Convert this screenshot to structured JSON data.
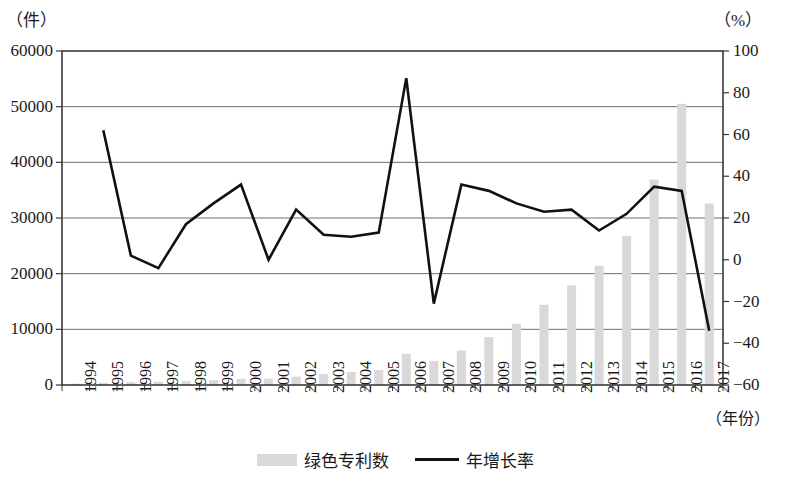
{
  "axes": {
    "left_unit": "（件）",
    "right_unit": "（%）",
    "x_title": "（年份）",
    "left_ticks": [
      "60000",
      "50000",
      "40000",
      "30000",
      "20000",
      "10000",
      "0"
    ],
    "right_ticks": [
      "100",
      "80",
      "60",
      "40",
      "20",
      "0",
      "−20",
      "−40",
      "−60"
    ]
  },
  "legend": {
    "bar_label": "绿色专利数",
    "line_label": "年增长率"
  },
  "colors": {
    "bar": "#d9d9d9",
    "line": "#111111",
    "grid": "#6f6f6f",
    "frame": "#3a3a3a"
  },
  "chart_data": {
    "type": "bar",
    "title": "",
    "subtitle": "",
    "xlabel": "（年份）",
    "ylabel": "（件）",
    "y2label": "（%）",
    "grid": true,
    "legend_position": "bottom-center",
    "categories": [
      "1994",
      "1995",
      "1996",
      "1997",
      "1998",
      "1999",
      "2000",
      "2001",
      "2002",
      "2003",
      "2004",
      "2005",
      "2006",
      "2007",
      "2008",
      "2009",
      "2010",
      "2011",
      "2012",
      "2013",
      "2014",
      "2015",
      "2016",
      "2017"
    ],
    "ylim": [
      0,
      60000
    ],
    "y2lim": [
      -60,
      100
    ],
    "series": [
      {
        "name": "绿色专利数",
        "type": "bar",
        "axis": "left",
        "values": [
          250,
          400,
          500,
          600,
          700,
          850,
          1100,
          1150,
          1500,
          1950,
          2350,
          2700,
          5600,
          4300,
          6200,
          8600,
          11000,
          14400,
          17900,
          21400,
          26800,
          36900,
          50500,
          32600
        ]
      },
      {
        "name": "年增长率",
        "type": "line",
        "axis": "right",
        "values": [
          null,
          62,
          2,
          -4,
          17,
          27,
          36,
          0,
          24,
          12,
          11,
          13,
          87,
          -21,
          36,
          33,
          27,
          23,
          24,
          14,
          22,
          35,
          33,
          -34
        ]
      }
    ]
  }
}
